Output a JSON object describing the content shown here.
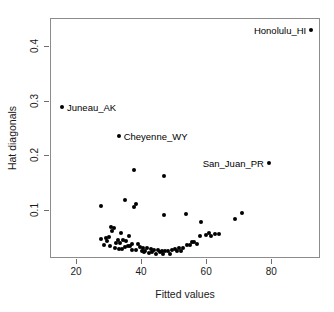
{
  "chart_data": {
    "type": "scatter",
    "title": "",
    "xlabel": "Fitted values",
    "ylabel": "Hat diagonals",
    "xlim": [
      12,
      95
    ],
    "ylim": [
      0.012,
      0.452
    ],
    "xticks": [
      20,
      40,
      60,
      80
    ],
    "xticklabels": [
      "20",
      "40",
      "60",
      "80"
    ],
    "yticks": [
      0.1,
      0.2,
      0.3,
      0.4
    ],
    "yticklabels": [
      "0.1",
      "0.2",
      "0.3",
      "0.4"
    ],
    "grid": false,
    "legend": "none",
    "point_color": "#000000",
    "box_color": "#8c8c8c",
    "labeled_points": [
      {
        "label": "Honolulu_HI",
        "x": 92.0,
        "y": 0.432,
        "label_side": "left"
      },
      {
        "label": "Juneau_AK",
        "x": 15.4,
        "y": 0.29,
        "label_side": "right"
      },
      {
        "label": "Cheyenne_WY",
        "x": 32.8,
        "y": 0.237,
        "label_side": "right"
      },
      {
        "label": "San_Juan_PR",
        "x": 79.0,
        "y": 0.188,
        "label_side": "left"
      }
    ],
    "points": [
      {
        "x": 37.6,
        "y": 0.175
      },
      {
        "x": 46.8,
        "y": 0.164
      },
      {
        "x": 34.6,
        "y": 0.12
      },
      {
        "x": 38.2,
        "y": 0.113
      },
      {
        "x": 37.4,
        "y": 0.108
      },
      {
        "x": 27.5,
        "y": 0.11
      },
      {
        "x": 70.8,
        "y": 0.096
      },
      {
        "x": 53.4,
        "y": 0.095
      },
      {
        "x": 46.6,
        "y": 0.092
      },
      {
        "x": 68.7,
        "y": 0.086
      },
      {
        "x": 58.2,
        "y": 0.079
      },
      {
        "x": 30.5,
        "y": 0.07
      },
      {
        "x": 31.3,
        "y": 0.068
      },
      {
        "x": 30.8,
        "y": 0.063
      },
      {
        "x": 33.6,
        "y": 0.06
      },
      {
        "x": 60.5,
        "y": 0.06
      },
      {
        "x": 62.4,
        "y": 0.058
      },
      {
        "x": 63.5,
        "y": 0.057
      },
      {
        "x": 59.6,
        "y": 0.056
      },
      {
        "x": 57.8,
        "y": 0.055
      },
      {
        "x": 36.0,
        "y": 0.054
      },
      {
        "x": 29.7,
        "y": 0.053
      },
      {
        "x": 28.9,
        "y": 0.05
      },
      {
        "x": 27.3,
        "y": 0.048
      },
      {
        "x": 32.5,
        "y": 0.047
      },
      {
        "x": 34.0,
        "y": 0.046
      },
      {
        "x": 35.2,
        "y": 0.045
      },
      {
        "x": 29.3,
        "y": 0.045
      },
      {
        "x": 56.0,
        "y": 0.044
      },
      {
        "x": 55.2,
        "y": 0.043
      },
      {
        "x": 31.9,
        "y": 0.042
      },
      {
        "x": 33.1,
        "y": 0.041
      },
      {
        "x": 37.0,
        "y": 0.04
      },
      {
        "x": 38.6,
        "y": 0.039
      },
      {
        "x": 53.8,
        "y": 0.038
      },
      {
        "x": 54.6,
        "y": 0.037
      },
      {
        "x": 36.4,
        "y": 0.036
      },
      {
        "x": 35.6,
        "y": 0.035
      },
      {
        "x": 34.8,
        "y": 0.034
      },
      {
        "x": 39.4,
        "y": 0.034
      },
      {
        "x": 40.2,
        "y": 0.033
      },
      {
        "x": 41.5,
        "y": 0.032
      },
      {
        "x": 52.6,
        "y": 0.033
      },
      {
        "x": 51.4,
        "y": 0.032
      },
      {
        "x": 50.2,
        "y": 0.031
      },
      {
        "x": 42.6,
        "y": 0.03
      },
      {
        "x": 43.8,
        "y": 0.029
      },
      {
        "x": 44.9,
        "y": 0.028
      },
      {
        "x": 49.1,
        "y": 0.028
      },
      {
        "x": 48.0,
        "y": 0.027
      },
      {
        "x": 46.0,
        "y": 0.026
      },
      {
        "x": 47.1,
        "y": 0.026
      },
      {
        "x": 45.4,
        "y": 0.025
      },
      {
        "x": 43.2,
        "y": 0.025
      },
      {
        "x": 41.0,
        "y": 0.026
      },
      {
        "x": 39.9,
        "y": 0.027
      },
      {
        "x": 38.0,
        "y": 0.028
      },
      {
        "x": 36.8,
        "y": 0.029
      },
      {
        "x": 33.9,
        "y": 0.03
      },
      {
        "x": 32.8,
        "y": 0.031
      },
      {
        "x": 31.6,
        "y": 0.032
      },
      {
        "x": 30.2,
        "y": 0.035
      },
      {
        "x": 28.4,
        "y": 0.038
      },
      {
        "x": 50.8,
        "y": 0.026
      },
      {
        "x": 52.0,
        "y": 0.027
      },
      {
        "x": 44.2,
        "y": 0.022
      },
      {
        "x": 46.4,
        "y": 0.021
      },
      {
        "x": 48.6,
        "y": 0.022
      },
      {
        "x": 42.0,
        "y": 0.023
      },
      {
        "x": 40.6,
        "y": 0.024
      },
      {
        "x": 56.8,
        "y": 0.04
      },
      {
        "x": 61.2,
        "y": 0.054
      }
    ]
  }
}
